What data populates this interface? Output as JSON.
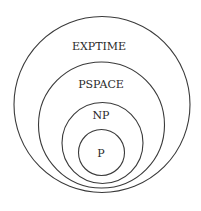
{
  "diagram": {
    "sets": [
      {
        "label": "EXPTIME",
        "cx": 102,
        "cy": 104.5,
        "r": 88,
        "label_x": 99,
        "label_y": 46
      },
      {
        "label": "PSPACE",
        "cx": 101.5,
        "cy": 125,
        "r": 63,
        "label_x": 101,
        "label_y": 84
      },
      {
        "label": "NP",
        "cx": 102.5,
        "cy": 143,
        "r": 40.5,
        "label_x": 101,
        "label_y": 115
      },
      {
        "label": "P",
        "cx": 101.5,
        "cy": 152.5,
        "r": 23,
        "label_x": 101,
        "label_y": 153
      }
    ],
    "stroke_color": "#3a3a3a",
    "background": "#ffffff"
  }
}
